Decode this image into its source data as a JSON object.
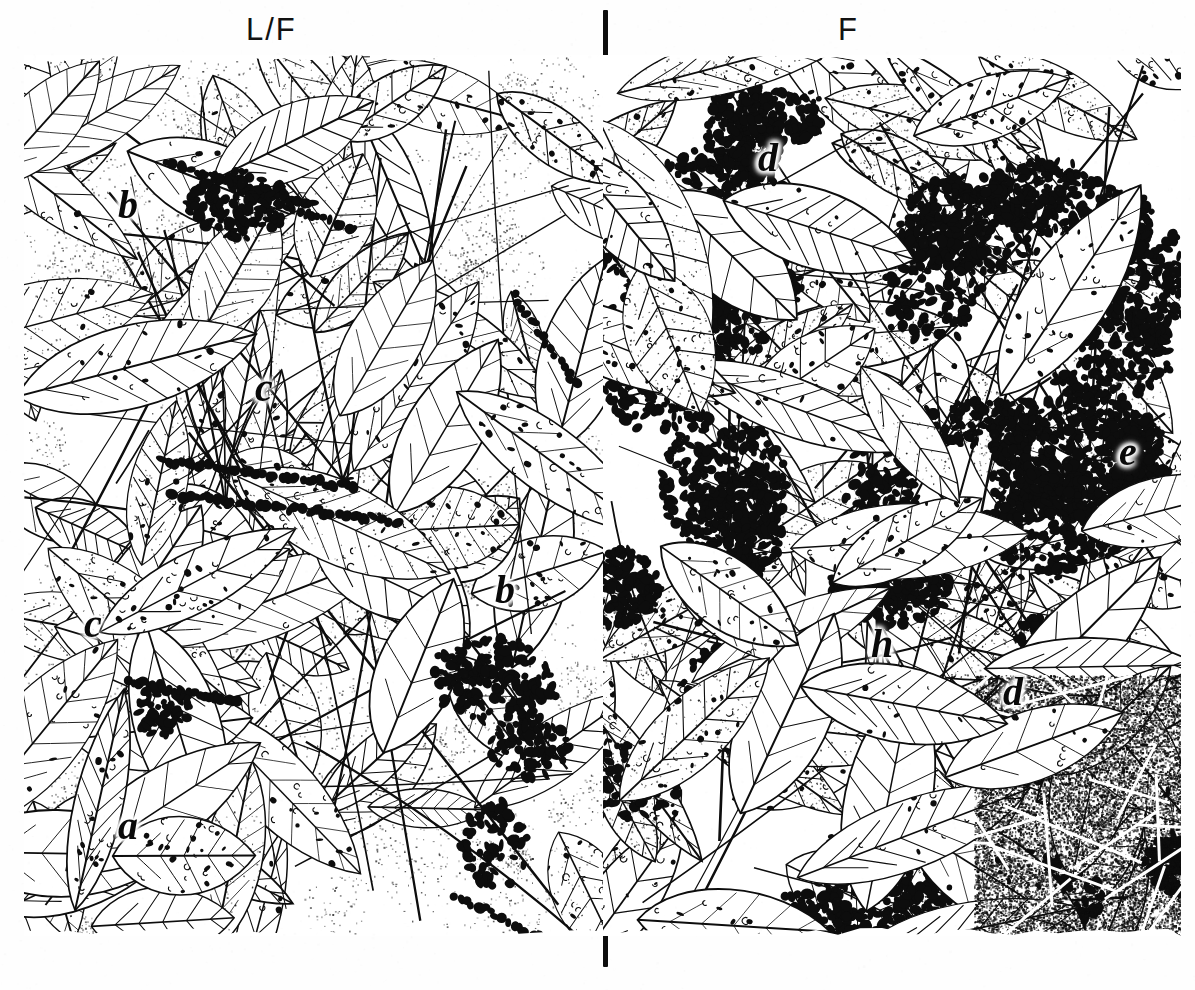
{
  "plate": {
    "title": "Leaf litter / forest floor comparison plate",
    "description": "Pen-and-ink stipple illustration of beech leaf litter divided into two sampling zones by vertical tick marks.",
    "background_color": "#ffffff",
    "ink_color": "#0d0d0d"
  },
  "zones": [
    {
      "id": "left",
      "label": "L/F",
      "label_x": 246,
      "label_y": 12,
      "character": "sparse-infestation",
      "note": "clean line-drawn leaves, light stipple, scattered dark egg clusters"
    },
    {
      "id": "right",
      "label": "F",
      "label_x": 838,
      "label_y": 12,
      "character": "dense-infestation",
      "note": "heavy clustered dark masses and dense stipple over leaves"
    }
  ],
  "divider": {
    "x": 603,
    "color": "#0d0d0d",
    "ticks": [
      {
        "name": "top",
        "y": 10,
        "height": 46
      },
      {
        "name": "bottom",
        "y": 934,
        "height": 33
      }
    ]
  },
  "frame": {
    "x": 24,
    "y": 55,
    "width": 1157,
    "height": 881
  },
  "callouts": [
    {
      "letter": "b",
      "x": 118,
      "y": 185,
      "zone": "left"
    },
    {
      "letter": "c",
      "x": 255,
      "y": 368,
      "zone": "left"
    },
    {
      "letter": "c",
      "x": 84,
      "y": 604,
      "zone": "left"
    },
    {
      "letter": "b",
      "x": 495,
      "y": 570,
      "zone": "left"
    },
    {
      "letter": "a",
      "x": 118,
      "y": 806,
      "zone": "left"
    },
    {
      "letter": "d",
      "x": 758,
      "y": 138,
      "zone": "right"
    },
    {
      "letter": "e",
      "x": 1119,
      "y": 432,
      "zone": "right"
    },
    {
      "letter": "h",
      "x": 871,
      "y": 624,
      "zone": "right"
    },
    {
      "letter": "d",
      "x": 1003,
      "y": 672,
      "zone": "right"
    }
  ]
}
